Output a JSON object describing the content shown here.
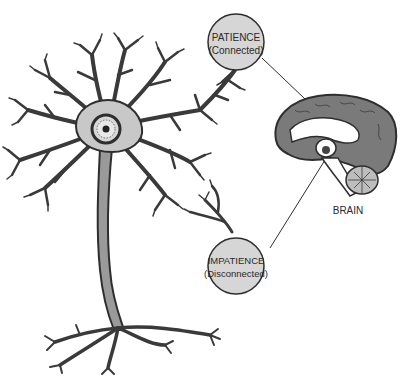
{
  "diagram": {
    "labels": {
      "patience_title": "PATIENCE",
      "patience_sub": "(Connected)",
      "impatience_title": "IMPATIENCE",
      "impatience_sub": "(Disconnected)",
      "brain": "BRAIN"
    },
    "colors": {
      "outline": "#2e2e2e",
      "dendrite": "#3a3a3a",
      "soma_fill": "#c8c8c8",
      "axon_fill": "#9a9a9a",
      "circle_fill": "#d6d6d6",
      "cortex_fill": "#7a7a7a",
      "background": "#ffffff"
    }
  }
}
